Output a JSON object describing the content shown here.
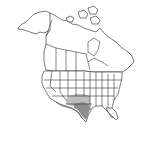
{
  "map": {
    "type": "range-map",
    "region": "North America",
    "background": "#ffffff",
    "outline_color": "#222222",
    "range": {
      "description": "Species range shaded gray in south-central United States",
      "areas": [
        {
          "name": "range-light",
          "color": "#bdbdbd",
          "states": [
            "Kansas (south)",
            "Oklahoma",
            "New Mexico (east)",
            "Texas (north/west)"
          ]
        },
        {
          "name": "range-dark",
          "color": "#8f8f8f",
          "states": [
            "Texas (central/south)"
          ]
        }
      ]
    }
  }
}
